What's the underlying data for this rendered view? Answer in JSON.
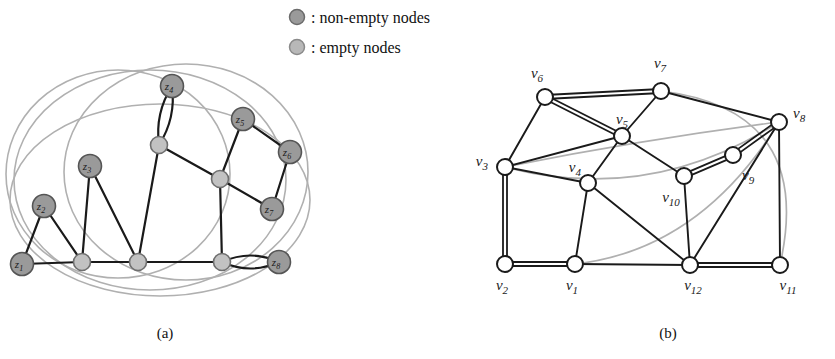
{
  "figure": {
    "width": 835,
    "height": 359,
    "background": "#ffffff"
  },
  "legend": {
    "items": [
      {
        "marker": "filled-circle-dark",
        "color": "#9a9a9a",
        "stroke": "#6b6b6b",
        "label": ": non-empty nodes"
      },
      {
        "marker": "filled-circle-light",
        "color": "#b8b8b8",
        "stroke": "#8a8a8a",
        "label": ": empty nodes"
      }
    ]
  },
  "captions": {
    "a": "(a)",
    "b": "(b)"
  },
  "colors": {
    "edge": "#1a1a1a",
    "arc": "#b0b0b0",
    "node_nonempty_fill": "#9a9a9a",
    "node_nonempty_stroke": "#555555",
    "node_empty_fill": "#c2c2c2",
    "node_empty_stroke": "#6f6f6f",
    "node_white_fill": "#ffffff",
    "node_white_stroke": "#1a1a1a",
    "text": "#111111"
  },
  "graph_a": {
    "name": "graph-a",
    "nodes": [
      {
        "id": "z1",
        "label": "z",
        "sub": "1",
        "x": 22,
        "y": 264,
        "type": "non-empty",
        "lx": 22,
        "ly": 266
      },
      {
        "id": "z2",
        "label": "z",
        "sub": "2",
        "x": 44,
        "y": 206,
        "type": "non-empty",
        "lx": 44,
        "ly": 208
      },
      {
        "id": "z3",
        "label": "z",
        "sub": "3",
        "x": 90,
        "y": 166,
        "type": "non-empty",
        "lx": 90,
        "ly": 168
      },
      {
        "id": "z4",
        "label": "z",
        "sub": "4",
        "x": 172,
        "y": 86,
        "type": "non-empty",
        "lx": 172,
        "ly": 88
      },
      {
        "id": "z5",
        "label": "z",
        "sub": "5",
        "x": 243,
        "y": 119,
        "type": "non-empty",
        "lx": 243,
        "ly": 121
      },
      {
        "id": "z6",
        "label": "z",
        "sub": "6",
        "x": 290,
        "y": 152,
        "type": "non-empty",
        "lx": 290,
        "ly": 154
      },
      {
        "id": "z7",
        "label": "z",
        "sub": "7",
        "x": 272,
        "y": 209,
        "type": "non-empty",
        "lx": 272,
        "ly": 211
      },
      {
        "id": "z8",
        "label": "z",
        "sub": "8",
        "x": 279,
        "y": 262,
        "type": "non-empty",
        "lx": 279,
        "ly": 264
      },
      {
        "id": "e1",
        "label": "",
        "sub": "",
        "x": 82,
        "y": 262,
        "type": "empty"
      },
      {
        "id": "e2",
        "label": "",
        "sub": "",
        "x": 138,
        "y": 262,
        "type": "empty"
      },
      {
        "id": "e3",
        "label": "",
        "sub": "",
        "x": 159,
        "y": 145,
        "type": "empty"
      },
      {
        "id": "e4",
        "label": "",
        "sub": "",
        "x": 220,
        "y": 179,
        "type": "empty"
      },
      {
        "id": "e5",
        "label": "",
        "sub": "",
        "x": 222,
        "y": 262,
        "type": "empty"
      }
    ],
    "edges": [
      {
        "from": "z1",
        "to": "z2"
      },
      {
        "from": "z1",
        "to": "e1"
      },
      {
        "from": "z2",
        "to": "e1"
      },
      {
        "from": "z3",
        "to": "e1"
      },
      {
        "from": "z3",
        "to": "e2"
      },
      {
        "from": "e1",
        "to": "e2"
      },
      {
        "from": "e2",
        "to": "e3"
      },
      {
        "from": "e2",
        "to": "e5"
      },
      {
        "from": "e3",
        "to": "e4"
      },
      {
        "from": "z5",
        "to": "e4"
      },
      {
        "from": "z5",
        "to": "z6"
      },
      {
        "from": "z6",
        "to": "z7"
      },
      {
        "from": "z7",
        "to": "e4"
      },
      {
        "from": "e4",
        "to": "e5"
      }
    ],
    "multi_edges": [
      {
        "from": "z4",
        "to": "e3",
        "bulge": 11
      },
      {
        "from": "e5",
        "to": "z8",
        "bulge": 13
      }
    ],
    "arcs": [
      {
        "cx": 150,
        "cy": 180,
        "rx": 136,
        "ry": 110
      },
      {
        "cx": 118,
        "cy": 174,
        "rx": 112,
        "ry": 104
      },
      {
        "cx": 186,
        "cy": 172,
        "rx": 122,
        "ry": 108
      },
      {
        "cx": 160,
        "cy": 200,
        "rx": 150,
        "ry": 96
      }
    ]
  },
  "graph_b": {
    "name": "graph-b",
    "nodes": [
      {
        "id": "v1",
        "label": "v",
        "sub": "1",
        "x": 575,
        "y": 264,
        "lx": 572,
        "ly": 290,
        "anchor": "middle"
      },
      {
        "id": "v2",
        "label": "v",
        "sub": "2",
        "x": 505,
        "y": 264,
        "lx": 502,
        "ly": 290,
        "anchor": "middle"
      },
      {
        "id": "v3",
        "label": "v",
        "sub": "3",
        "x": 505,
        "y": 167,
        "lx": 488,
        "ly": 166,
        "anchor": "end"
      },
      {
        "id": "v4",
        "label": "v",
        "sub": "4",
        "x": 588,
        "y": 183,
        "lx": 581,
        "ly": 172,
        "anchor": "end"
      },
      {
        "id": "v5",
        "label": "v",
        "sub": "5",
        "x": 622,
        "y": 136,
        "lx": 622,
        "ly": 124,
        "anchor": "middle"
      },
      {
        "id": "v6",
        "label": "v",
        "sub": "6",
        "x": 545,
        "y": 97,
        "lx": 537,
        "ly": 78,
        "anchor": "middle"
      },
      {
        "id": "v7",
        "label": "v",
        "sub": "7",
        "x": 661,
        "y": 91,
        "lx": 660,
        "ly": 68,
        "anchor": "middle"
      },
      {
        "id": "v8",
        "label": "v",
        "sub": "8",
        "x": 779,
        "y": 122,
        "lx": 793,
        "ly": 118,
        "anchor": "start"
      },
      {
        "id": "v9",
        "label": "v",
        "sub": "9",
        "x": 733,
        "y": 155,
        "lx": 742,
        "ly": 180,
        "anchor": "start"
      },
      {
        "id": "v10",
        "label": "v",
        "sub": "10",
        "x": 684,
        "y": 176,
        "lx": 671,
        "ly": 202,
        "anchor": "middle"
      },
      {
        "id": "v11",
        "label": "v",
        "sub": "11",
        "x": 780,
        "y": 265,
        "lx": 788,
        "ly": 290,
        "anchor": "middle"
      },
      {
        "id": "v12",
        "label": "v",
        "sub": "12",
        "x": 690,
        "y": 265,
        "lx": 693,
        "ly": 290,
        "anchor": "middle"
      }
    ],
    "edges": [
      {
        "from": "v6",
        "to": "v3",
        "double": false
      },
      {
        "from": "v6",
        "to": "v7",
        "double": true
      },
      {
        "from": "v6",
        "to": "v5",
        "double": true
      },
      {
        "from": "v5",
        "to": "v7",
        "double": false
      },
      {
        "from": "v5",
        "to": "v3",
        "double": false
      },
      {
        "from": "v5",
        "to": "v4",
        "double": false
      },
      {
        "from": "v5",
        "to": "v10",
        "double": false
      },
      {
        "from": "v7",
        "to": "v8",
        "double": false
      },
      {
        "from": "v8",
        "to": "v9",
        "double": true
      },
      {
        "from": "v8",
        "to": "v11",
        "double": false
      },
      {
        "from": "v8",
        "to": "v12",
        "double": false
      },
      {
        "from": "v9",
        "to": "v10",
        "double": true
      },
      {
        "from": "v10",
        "to": "v12",
        "double": false
      },
      {
        "from": "v3",
        "to": "v4",
        "double": false
      },
      {
        "from": "v3",
        "to": "v2",
        "double": true
      },
      {
        "from": "v4",
        "to": "v1",
        "double": false
      },
      {
        "from": "v4",
        "to": "v12",
        "double": false
      },
      {
        "from": "v2",
        "to": "v1",
        "double": true
      },
      {
        "from": "v1",
        "to": "v12",
        "double": false
      },
      {
        "from": "v12",
        "to": "v11",
        "double": true
      }
    ],
    "arcs": [
      {
        "d": "M 505 167 Q 640 140 779 122"
      },
      {
        "d": "M 505 167 Q 650 205 779 122"
      },
      {
        "d": "M 575 264 Q 700 250 779 122"
      },
      {
        "d": "M 661 91 Q 815 110 780 265"
      }
    ]
  }
}
